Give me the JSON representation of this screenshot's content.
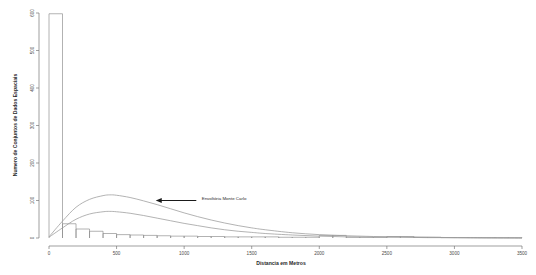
{
  "chart_data": {
    "type": "bar",
    "title": "",
    "subtitle": "",
    "xlabel": "Distancia em Metros",
    "ylabel": "Numero de Conjuntos de Dados Espaciais",
    "xlim": [
      0,
      3500
    ],
    "ylim": [
      0,
      600
    ],
    "grid": false,
    "legend_position": "none",
    "x_ticks": [
      0,
      500,
      1000,
      1500,
      2000,
      2500,
      3000,
      3500
    ],
    "x_tick_labels": [
      "0",
      "500",
      "1000",
      "1500",
      "2000",
      "2500",
      "3000",
      "3500"
    ],
    "y_ticks": [
      0,
      100,
      200,
      300,
      400,
      500,
      600
    ],
    "y_tick_labels": [
      "0",
      "100",
      "200",
      "300",
      "400",
      "500",
      "600"
    ],
    "bin_width": 100,
    "categories": [
      "0-100",
      "100-200",
      "200-300",
      "300-400",
      "400-500",
      "500-600",
      "600-700",
      "700-800",
      "800-900",
      "900-1000",
      "1000-1100",
      "1100-1200",
      "1200-1300",
      "1300-1400",
      "1400-1500",
      "1500-1600",
      "1600-1700",
      "1700-1800",
      "1800-1900",
      "1900-2000",
      "2000-2100",
      "2100-2200",
      "2200-2300",
      "2300-2400",
      "2400-2500",
      "2500-2600",
      "2600-2700",
      "2700-2800",
      "2800-2900",
      "2900-3000",
      "3000-3100",
      "3100-3200",
      "3200-3300",
      "3300-3400",
      "3400-3500"
    ],
    "values": [
      598,
      38,
      24,
      18,
      12,
      9,
      8,
      7,
      6,
      5,
      5,
      4,
      4,
      3,
      3,
      3,
      3,
      2,
      2,
      2,
      7,
      7,
      2,
      2,
      2,
      4,
      4,
      2,
      2,
      1,
      1,
      1,
      1,
      1,
      1
    ],
    "series": [
      {
        "name": "Envoltoria Monte Carlo Superior",
        "type": "line",
        "x": [
          0,
          100,
          200,
          300,
          400,
          450,
          500,
          600,
          700,
          800,
          900,
          1000,
          1100,
          1200,
          1300,
          1400,
          1500,
          1600,
          1800,
          2000,
          2200,
          2400,
          2600,
          2800,
          3000,
          3200,
          3500
        ],
        "values": [
          3,
          45,
          82,
          103,
          113,
          115,
          114,
          108,
          99,
          89,
          78,
          67,
          57,
          48,
          40,
          33,
          27,
          22,
          14,
          9,
          6,
          4,
          3,
          2,
          1,
          1,
          0
        ]
      },
      {
        "name": "Envoltoria Monte Carlo Inferior",
        "type": "line",
        "x": [
          0,
          100,
          200,
          300,
          400,
          450,
          500,
          600,
          700,
          800,
          900,
          1000,
          1100,
          1200,
          1300,
          1400,
          1500,
          1600,
          1800,
          2000,
          2200,
          2400,
          2600,
          2800,
          3000,
          3200,
          3500
        ],
        "values": [
          2,
          27,
          50,
          64,
          70,
          71,
          70,
          66,
          60,
          53,
          46,
          39,
          33,
          27,
          22,
          18,
          15,
          12,
          8,
          5,
          3,
          2,
          2,
          1,
          1,
          0,
          0
        ]
      }
    ],
    "annotations": [
      {
        "label": "Envoltória Monte Carlo",
        "text_x": 1130,
        "text_y": 105,
        "arrow_from_x": 1090,
        "arrow_from_y": 100,
        "arrow_to_x": 790,
        "arrow_to_y": 100
      }
    ],
    "colors": {
      "bar_stroke": "#888888",
      "curve": "#9a9a9a",
      "axis": "#777777",
      "text": "#2b2b2b",
      "arrow": "#1a1a1a",
      "background": "#ffffff"
    }
  }
}
